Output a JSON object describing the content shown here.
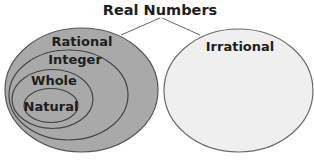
{
  "diagram": {
    "title": "Real Numbers",
    "type": "venn-nested-sets",
    "sets": [
      {
        "id": "rational",
        "label": "Rational",
        "parent": "real",
        "fill": "#a9a9a9"
      },
      {
        "id": "integer",
        "label": "Integer",
        "parent": "rational",
        "fill": "#a9a9a9"
      },
      {
        "id": "whole",
        "label": "Whole",
        "parent": "integer",
        "fill": "#a9a9a9"
      },
      {
        "id": "natural",
        "label": "Natural",
        "parent": "whole",
        "fill": "#a9a9a9"
      },
      {
        "id": "irrational",
        "label": "Irrational",
        "parent": "real",
        "fill": "#efefef"
      }
    ],
    "connectors": [
      {
        "from": "title",
        "to": "rational"
      },
      {
        "from": "title",
        "to": "irrational"
      }
    ],
    "colors": {
      "rational_fill": "#a9a9a9",
      "irrational_fill": "#efefef",
      "stroke": "#555555",
      "text": "#1e1e1e"
    }
  }
}
